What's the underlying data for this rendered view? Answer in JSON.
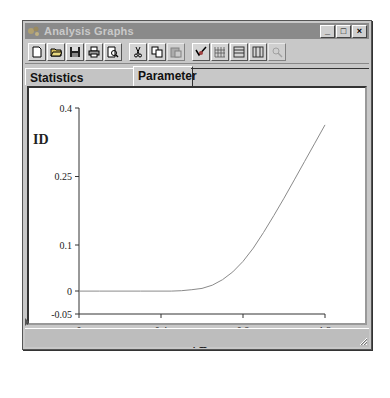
{
  "window": {
    "title": "Analysis Graphs",
    "controls": [
      "_",
      "□",
      "×"
    ]
  },
  "toolbar": {
    "groups": [
      [
        {
          "icon": "new-document-icon"
        },
        {
          "icon": "open-folder-icon"
        },
        {
          "icon": "save-icon"
        },
        {
          "icon": "print-icon"
        },
        {
          "icon": "print-preview-icon"
        }
      ],
      [
        {
          "icon": "cut-icon"
        },
        {
          "icon": "copy-icon"
        },
        {
          "icon": "paste-icon"
        }
      ],
      [
        {
          "icon": "properties-icon"
        },
        {
          "icon": "grid-icon"
        },
        {
          "icon": "horizontal-lines-icon"
        },
        {
          "icon": "vertical-lines-icon"
        },
        {
          "icon": "zoom-icon",
          "disabled": true
        }
      ]
    ]
  },
  "tabs": [
    {
      "label": "Statistics [Analog]",
      "active": false
    },
    {
      "label": "Parameter",
      "active": true
    }
  ],
  "chart_data": {
    "type": "line",
    "title": "",
    "xlabel": "VD",
    "ylabel": "ID",
    "xlim": [
      0,
      1.2
    ],
    "ylim": [
      -0.05,
      0.4
    ],
    "x_ticks": [
      "0",
      "0.4",
      "0.8",
      "1.2"
    ],
    "y_ticks": [
      "0.4",
      "0.25",
      "0.1",
      "0",
      "-0.05"
    ],
    "grid": false,
    "legend": null,
    "series": [
      {
        "name": "ID",
        "color": "#8a8a8a",
        "x": [
          0,
          0.1,
          0.2,
          0.3,
          0.4,
          0.45,
          0.5,
          0.55,
          0.6,
          0.65,
          0.7,
          0.75,
          0.8,
          0.85,
          0.9,
          0.95,
          1.0,
          1.05,
          1.1,
          1.15,
          1.2
        ],
        "y": [
          0,
          0,
          0,
          0,
          0,
          0,
          0.001,
          0.003,
          0.006,
          0.013,
          0.025,
          0.042,
          0.065,
          0.094,
          0.128,
          0.165,
          0.203,
          0.243,
          0.283,
          0.323,
          0.363
        ]
      }
    ]
  }
}
